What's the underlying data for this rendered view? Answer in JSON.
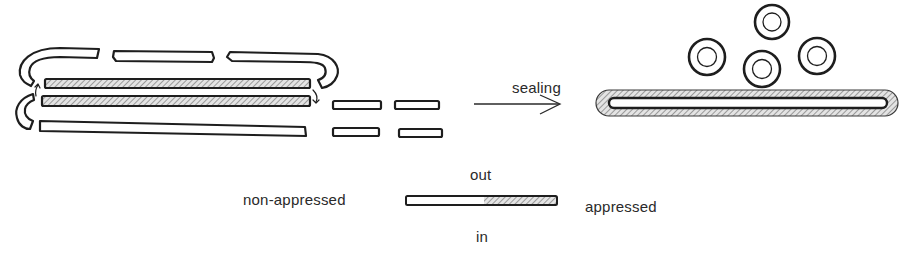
{
  "diagram": {
    "arrow_label": "sealing",
    "legend": {
      "top_label": "out",
      "bottom_label": "in",
      "left_label": "non-appressed",
      "right_label": "appressed"
    },
    "colors": {
      "stroke": "#1e1e1e",
      "hatch": "#8a8a8a",
      "background": "#ffffff"
    },
    "panels": [
      {
        "id": "stacked-membranes",
        "description": "stacked thylakoid membranes with fragments"
      },
      {
        "id": "fragments",
        "count": 4
      },
      {
        "id": "sealed-products",
        "vesicles": 4,
        "sealed_appressed_sheet": 1
      }
    ]
  }
}
